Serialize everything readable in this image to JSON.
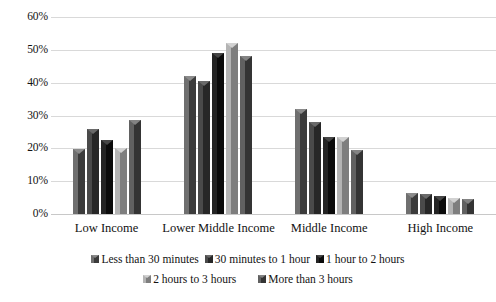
{
  "chart_data": {
    "type": "bar",
    "title": "",
    "subtitle": "",
    "xlabel": "",
    "ylabel": "",
    "ylim": [
      0,
      60
    ],
    "ytick_step": 10,
    "ytick_labels": [
      "0%",
      "10%",
      "20%",
      "30%",
      "40%",
      "50%",
      "60%"
    ],
    "ytick_values": [
      0,
      10,
      20,
      30,
      40,
      50,
      60
    ],
    "grid": true,
    "legend_position": "bottom",
    "categories": [
      "Low Income",
      "Lower Middle Income",
      "Middle Income",
      "High Income"
    ],
    "series": [
      {
        "name": "Less than 30 minutes",
        "values": [
          19.7,
          42.0,
          32.0,
          6.5
        ]
      },
      {
        "name": "30 minutes to 1 hour",
        "values": [
          26.0,
          40.5,
          28.0,
          6.0
        ]
      },
      {
        "name": "1 hour to 2 hours",
        "values": [
          22.5,
          49.0,
          23.5,
          5.5
        ]
      },
      {
        "name": "2 hours to 3 hours",
        "values": [
          20.0,
          52.0,
          23.5,
          5.0
        ]
      },
      {
        "name": "More than 3 hours",
        "values": [
          28.5,
          48.0,
          19.5,
          4.5
        ]
      }
    ]
  },
  "colors": {
    "series": [
      "#5a5a5a",
      "#3a3a3a",
      "#141414",
      "#9c9c9c",
      "#4d4d4d"
    ],
    "gridline": "#d9d9d9",
    "text": "#121212",
    "background": "#ffffff"
  }
}
